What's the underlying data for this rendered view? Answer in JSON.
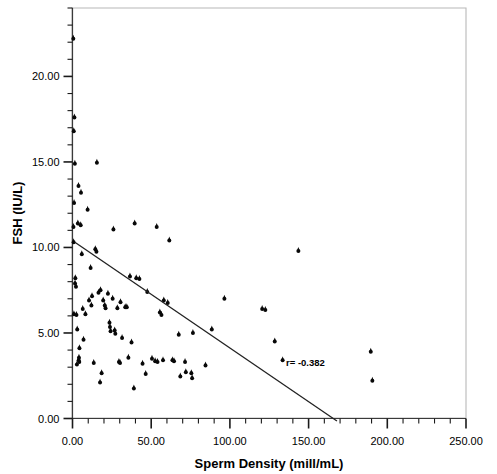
{
  "chart_data": {
    "type": "scatter",
    "title": "",
    "xlabel": "Sperm Density (mill/mL)",
    "ylabel": "FSH (IU/L)",
    "xlim": [
      0,
      250
    ],
    "ylim": [
      0,
      24
    ],
    "grid": false,
    "legend": null,
    "x_ticks": [
      0,
      50,
      100,
      150,
      200,
      250
    ],
    "x_tick_labels": [
      "0.00",
      "50.00",
      "100.00",
      "150.00",
      "200.00",
      "250.00"
    ],
    "x_minor_step": 10,
    "y_ticks": [
      0,
      5,
      10,
      15,
      20
    ],
    "y_tick_labels": [
      "0.00",
      "5.00",
      "10.00",
      "15.00",
      "20.00"
    ],
    "y_minor_step": 1,
    "annotations": [
      {
        "text": "r= -0.382",
        "x": 148,
        "y": 3.05
      }
    ],
    "trendline": {
      "x_start": 1.5,
      "y_start": 10.3,
      "x_end": 168,
      "y_end": -0.15,
      "r": -0.382
    },
    "points": [
      [
        0.5,
        22.2
      ],
      [
        1.2,
        17.6
      ],
      [
        0.8,
        16.8
      ],
      [
        1.5,
        14.9
      ],
      [
        3.8,
        13.6
      ],
      [
        5.4,
        13.2
      ],
      [
        15.5,
        14.95
      ],
      [
        1.0,
        12.6
      ],
      [
        9.6,
        12.2
      ],
      [
        3.4,
        11.4
      ],
      [
        5.2,
        11.3
      ],
      [
        0.6,
        11.2
      ],
      [
        26.0,
        11.05
      ],
      [
        39.5,
        11.4
      ],
      [
        53.5,
        11.2
      ],
      [
        0.7,
        10.3
      ],
      [
        61.5,
        10.4
      ],
      [
        143.5,
        9.8
      ],
      [
        5.9,
        9.6
      ],
      [
        14.5,
        9.9
      ],
      [
        15.2,
        9.75
      ],
      [
        1.8,
        8.2
      ],
      [
        1.6,
        7.9
      ],
      [
        2.2,
        7.7
      ],
      [
        11.5,
        8.8
      ],
      [
        36.5,
        8.3
      ],
      [
        40.5,
        8.2
      ],
      [
        42.5,
        8.15
      ],
      [
        0.9,
        6.1
      ],
      [
        6.5,
        6.4
      ],
      [
        8.2,
        6.1
      ],
      [
        12.4,
        7.15
      ],
      [
        16.5,
        7.35
      ],
      [
        17.8,
        7.5
      ],
      [
        20.5,
        6.6
      ],
      [
        22.5,
        7.3
      ],
      [
        25.5,
        7.0
      ],
      [
        28.5,
        6.45
      ],
      [
        30.5,
        6.8
      ],
      [
        33.5,
        6.5
      ],
      [
        47.5,
        7.4
      ],
      [
        58.0,
        6.9
      ],
      [
        60.5,
        6.75
      ],
      [
        55.5,
        6.2
      ],
      [
        56.5,
        6.05
      ],
      [
        96.5,
        7.0
      ],
      [
        120.5,
        6.4
      ],
      [
        122.5,
        6.35
      ],
      [
        3.0,
        5.2
      ],
      [
        23.5,
        5.6
      ],
      [
        23.8,
        5.35
      ],
      [
        24.2,
        5.1
      ],
      [
        88.5,
        5.2
      ],
      [
        7.0,
        4.6
      ],
      [
        31.5,
        4.7
      ],
      [
        37.5,
        4.45
      ],
      [
        67.5,
        4.9
      ],
      [
        76.5,
        5.0
      ],
      [
        128.5,
        4.5
      ],
      [
        4.4,
        4.1
      ],
      [
        4.1,
        3.55
      ],
      [
        3.9,
        3.4
      ],
      [
        4.3,
        3.3
      ],
      [
        13.5,
        3.25
      ],
      [
        29.5,
        3.3
      ],
      [
        30.2,
        3.25
      ],
      [
        35.5,
        3.55
      ],
      [
        50.5,
        3.5
      ],
      [
        57.5,
        3.4
      ],
      [
        63.5,
        3.4
      ],
      [
        64.5,
        3.35
      ],
      [
        71.5,
        3.3
      ],
      [
        84.5,
        3.1
      ],
      [
        133.5,
        3.4
      ],
      [
        18.5,
        2.65
      ],
      [
        46.5,
        2.6
      ],
      [
        72.0,
        2.7
      ],
      [
        75.5,
        2.65
      ],
      [
        76.0,
        2.35
      ],
      [
        189.5,
        3.9
      ],
      [
        190.5,
        2.2
      ],
      [
        17.5,
        2.1
      ],
      [
        39.0,
        1.75
      ],
      [
        2.5,
        6.05
      ],
      [
        2.8,
        3.15
      ],
      [
        19.5,
        6.9
      ],
      [
        21.0,
        6.45
      ],
      [
        26.8,
        5.15
      ],
      [
        27.2,
        4.95
      ],
      [
        34.5,
        6.5
      ],
      [
        44.5,
        3.2
      ],
      [
        52.5,
        3.35
      ],
      [
        54.0,
        3.3
      ],
      [
        68.5,
        2.45
      ],
      [
        12.0,
        6.6
      ],
      [
        10.5,
        6.9
      ]
    ]
  },
  "axis": {
    "x_title": "Sperm Density (mill/mL)",
    "y_title": "FSH (IU/L)"
  }
}
